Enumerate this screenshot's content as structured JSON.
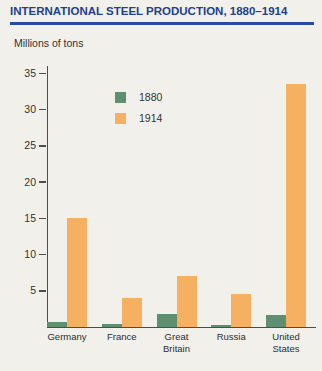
{
  "header": {
    "title": "INTERNATIONAL STEEL PRODUCTION, 1880–1914",
    "units_label": "Millions of tons"
  },
  "colors": {
    "title_text": "#21408f",
    "title_rule": "#2b4aa4",
    "axis": "#4d4d4d",
    "background": "#f2f0ea",
    "series_1880": "#5f8f71",
    "series_1914": "#f5b161"
  },
  "chart_data": {
    "type": "bar",
    "title": "INTERNATIONAL STEEL PRODUCTION, 1880–1914",
    "xlabel": "",
    "ylabel": "Millions of tons",
    "categories": [
      "Germany",
      "France",
      "Great Britain",
      "Russia",
      "United States"
    ],
    "series": [
      {
        "name": "1880",
        "color": "#5f8f71",
        "values": [
          0.7,
          0.4,
          1.8,
          0.3,
          1.7
        ]
      },
      {
        "name": "1914",
        "color": "#f5b161",
        "values": [
          15,
          4,
          7,
          4.5,
          33.5
        ]
      }
    ],
    "ylim": [
      0,
      36
    ],
    "yticks": [
      5,
      10,
      15,
      20,
      25,
      30,
      35
    ],
    "grid": false,
    "legend_position": "upper-left-inside"
  }
}
